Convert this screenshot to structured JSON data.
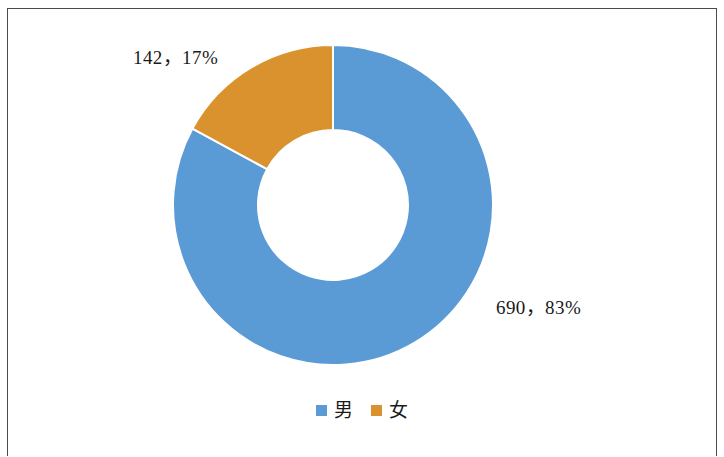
{
  "figure": {
    "background_color": "#ffffff",
    "frame_color": "#4a4a4a"
  },
  "chart_data": {
    "type": "pie",
    "variant": "donut",
    "title": "",
    "subtitle": "",
    "xlabel": "",
    "ylabel": "",
    "grid": false,
    "legend_position": "bottom",
    "start_angle_deg": 0,
    "direction": "clockwise",
    "inner_radius_ratio": 0.47,
    "categories": [
      "男",
      "女"
    ],
    "values": [
      690,
      142
    ],
    "percentages": [
      83,
      17
    ],
    "total": 832,
    "colors": [
      "#5B9BD5",
      "#D9922E"
    ],
    "slices": [
      {
        "label": "男",
        "value": 690,
        "percent": 83,
        "color": "#5B9BD5",
        "data_label": "690，83%"
      },
      {
        "label": "女",
        "value": 142,
        "percent": 17,
        "color": "#D9922E",
        "data_label": "142，17%"
      }
    ],
    "data_labels": [
      "690，83%",
      "142，17%"
    ],
    "annotations": []
  },
  "labels": {
    "female": "142，17%",
    "male": "690，83%"
  },
  "legend": {
    "items": [
      {
        "label": "男",
        "color": "#5B9BD5"
      },
      {
        "label": "女",
        "color": "#D9922E"
      }
    ]
  }
}
